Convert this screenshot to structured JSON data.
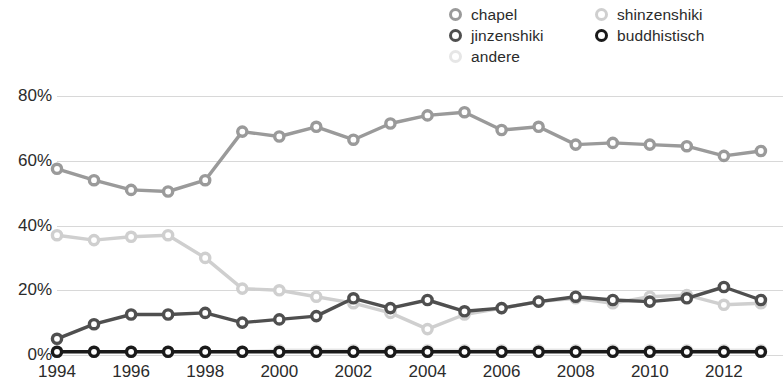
{
  "legend": {
    "columns": [
      {
        "items": [
          {
            "label": "chapel",
            "color": "#9a9a9a",
            "marker": "open-circle-marker"
          },
          {
            "label": "jinzenshiki",
            "color": "#4f4f4f",
            "marker": "open-circle-marker"
          },
          {
            "label": "andere",
            "color": "#e6e6e6",
            "marker": "open-circle-marker"
          }
        ]
      },
      {
        "items": [
          {
            "label": "shinzenshiki",
            "color": "#cfcfcf",
            "marker": "open-circle-marker"
          },
          {
            "label": "buddhistisch",
            "color": "#1a1a1a",
            "marker": "open-circle-marker"
          }
        ]
      }
    ]
  },
  "axes": {
    "y_ticks": [
      "80%",
      "60%",
      "40%",
      "20%",
      "0%"
    ],
    "x_ticks": [
      "1994",
      "1996",
      "1998",
      "2000",
      "2002",
      "2004",
      "2006",
      "2008",
      "2010",
      "2012"
    ]
  },
  "chart_data": {
    "type": "line",
    "title": "",
    "xlabel": "",
    "ylabel": "",
    "ylim": [
      0,
      80
    ],
    "yunit": "%",
    "ytick_values": [
      0,
      20,
      40,
      60,
      80
    ],
    "grid": true,
    "legend_position": "top-right",
    "marker": "open-circle",
    "x": [
      1994,
      1995,
      1996,
      1997,
      1998,
      1999,
      2000,
      2001,
      2002,
      2003,
      2004,
      2005,
      2006,
      2007,
      2008,
      2009,
      2010,
      2011,
      2012,
      2013
    ],
    "series": [
      {
        "name": "chapel",
        "color": "#9a9a9a",
        "values": [
          57.5,
          54.0,
          51.0,
          50.5,
          54.0,
          69.0,
          67.5,
          70.5,
          66.5,
          71.5,
          74.0,
          75.0,
          69.5,
          70.5,
          65.0,
          65.5,
          65.0,
          64.5,
          61.5,
          63.0
        ]
      },
      {
        "name": "shinzenshiki",
        "color": "#cfcfcf",
        "values": [
          37.0,
          35.5,
          36.5,
          37.0,
          30.0,
          20.5,
          20.0,
          18.0,
          16.0,
          13.0,
          8.0,
          12.5,
          14.5,
          16.5,
          17.5,
          16.0,
          18.0,
          18.5,
          15.5,
          16.0
        ]
      },
      {
        "name": "jinzenshiki",
        "color": "#4f4f4f",
        "values": [
          5.0,
          9.5,
          12.5,
          12.5,
          13.0,
          10.0,
          11.0,
          12.0,
          17.5,
          14.5,
          17.0,
          13.5,
          14.5,
          16.5,
          18.0,
          17.0,
          16.5,
          17.5,
          21.0,
          17.0
        ]
      },
      {
        "name": "andere",
        "color": "#e6e6e6",
        "values": [
          1.0,
          1.0,
          1.0,
          1.0,
          1.0,
          1.0,
          1.5,
          1.5,
          1.5,
          1.5,
          1.5,
          1.5,
          1.5,
          1.5,
          1.5,
          1.5,
          1.5,
          1.5,
          1.5,
          1.5
        ]
      },
      {
        "name": "buddhistisch",
        "color": "#1a1a1a",
        "values": [
          1.0,
          1.0,
          1.0,
          1.0,
          1.0,
          1.0,
          1.0,
          1.0,
          1.0,
          1.0,
          1.0,
          1.0,
          1.0,
          1.0,
          1.0,
          1.0,
          1.0,
          1.0,
          1.0,
          1.0
        ]
      }
    ]
  }
}
